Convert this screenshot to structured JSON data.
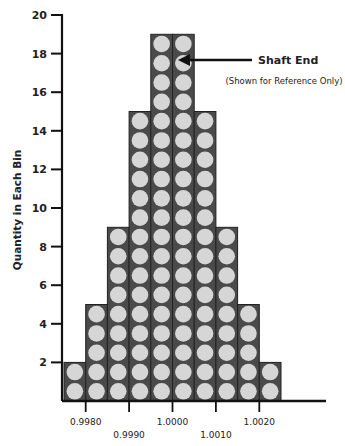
{
  "chart_data": {
    "type": "bar",
    "title": "",
    "xlabel": "",
    "ylabel": "Quantity  in Each Bin",
    "ylim": [
      0,
      20
    ],
    "yticks": [
      2,
      4,
      6,
      8,
      10,
      12,
      14,
      16,
      18,
      20
    ],
    "categories": [
      "bin1",
      "bin2",
      "bin3",
      "bin4",
      "bin5",
      "bin6",
      "bin7",
      "bin8",
      "bin9",
      "bin10"
    ],
    "values": [
      2,
      5,
      9,
      15,
      19,
      19,
      15,
      9,
      5,
      2
    ],
    "xtick_labels": [
      "0.9980",
      "0.9990",
      "1.0000",
      "1.0010",
      "1.0020"
    ],
    "grid": false,
    "legend": null,
    "style": "stacked circles (each circle = one shaft end)",
    "annotation": {
      "title": "Shaft End",
      "subtitle": "(Shown for Reference Only)",
      "points_to": {
        "bin": 6,
        "level": 18
      }
    },
    "colors": {
      "bin_fill": "#4a4a4a",
      "circle_fill": "#d6d6d6",
      "axis": "#111111"
    }
  }
}
